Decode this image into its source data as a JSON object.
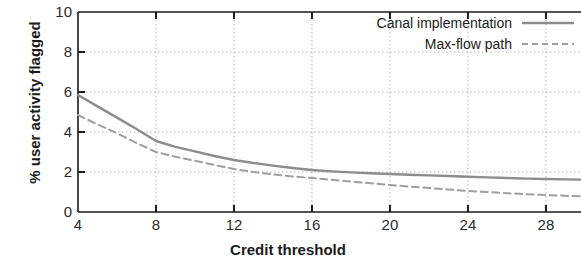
{
  "chart_data": {
    "type": "line",
    "title": "",
    "xlabel": "Credit threshold",
    "ylabel": "% user activity flagged",
    "xlim": [
      4,
      29.8
    ],
    "ylim": [
      0,
      10
    ],
    "xticks": [
      4,
      8,
      12,
      16,
      20,
      24,
      28
    ],
    "xticklabels": [
      "4",
      "8",
      "12",
      "16",
      "20",
      "24",
      "28"
    ],
    "yticks": [
      0,
      2,
      4,
      6,
      8,
      10
    ],
    "yticklabels": [
      "0",
      "2",
      "4",
      "6",
      "8",
      "10"
    ],
    "grid": true,
    "grid_style": "dotted",
    "grid_color": "#b4b4b4",
    "legend_position": "upper right",
    "line_color": "#8c8c8c",
    "axis_color": "#1a1a1a",
    "series": [
      {
        "name": "Canal implementation",
        "style": "solid",
        "color": "#8c8c8c",
        "x": [
          4,
          5,
          6,
          7,
          8,
          9,
          10,
          11,
          12,
          13,
          14,
          15,
          16,
          17,
          18,
          19,
          20,
          21,
          22,
          23,
          24,
          25,
          26,
          27,
          28,
          29,
          29.8
        ],
        "values": [
          5.85,
          5.28,
          4.72,
          4.15,
          3.55,
          3.26,
          3.03,
          2.8,
          2.6,
          2.45,
          2.32,
          2.2,
          2.1,
          2.03,
          1.98,
          1.94,
          1.9,
          1.86,
          1.83,
          1.8,
          1.76,
          1.73,
          1.7,
          1.67,
          1.65,
          1.63,
          1.62
        ]
      },
      {
        "name": "Max-flow path",
        "style": "dashed",
        "color": "#9e9e9e",
        "x": [
          4,
          5,
          6,
          7,
          8,
          9,
          10,
          11,
          12,
          13,
          14,
          15,
          16,
          17,
          18,
          19,
          20,
          21,
          22,
          23,
          24,
          25,
          26,
          27,
          28,
          29,
          29.8
        ],
        "values": [
          4.85,
          4.38,
          3.94,
          3.45,
          3.0,
          2.76,
          2.56,
          2.35,
          2.15,
          2.0,
          1.88,
          1.78,
          1.7,
          1.61,
          1.52,
          1.44,
          1.35,
          1.27,
          1.2,
          1.13,
          1.05,
          1.0,
          0.94,
          0.89,
          0.85,
          0.81,
          0.78
        ]
      }
    ]
  },
  "legend": {
    "items": [
      {
        "label": "Canal implementation",
        "style": "solid"
      },
      {
        "label": "Max-flow path",
        "style": "dashed"
      }
    ]
  }
}
